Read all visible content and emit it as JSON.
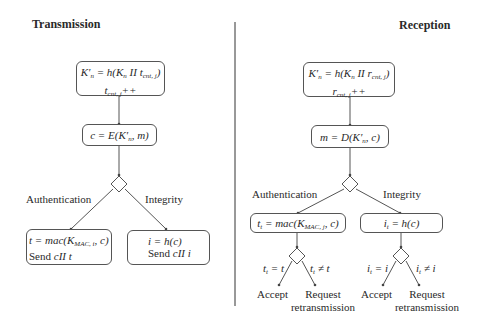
{
  "transmission": {
    "title": "Transmission",
    "key_box": {
      "line1_prefix": "K′",
      "line1_sub": "n",
      "line1_rest": " = h(K",
      "line1_sub2": "n",
      "line1_mid": " II t",
      "line1_sub3": "cnt, j",
      "line1_end": ")",
      "line2": "t",
      "line2_sub": "cnt, j",
      "line2_end": "++"
    },
    "encrypt_box": {
      "prefix": "c = E(K′",
      "sub": "n",
      "end": ", m)"
    },
    "branch_auth": "Authentication",
    "branch_integrity": "Integrity",
    "auth_box": {
      "line1_prefix": "t = mac(K",
      "line1_sub": "MAC, i",
      "line1_end": ", c)",
      "line2_prefix": "Send ",
      "line2_it": "cII t"
    },
    "integrity_box": {
      "line1": "i = h(c)",
      "line2_prefix": "Send ",
      "line2_it": "cII i"
    }
  },
  "reception": {
    "title": "Reception",
    "key_box": {
      "line1_prefix": "K′",
      "line1_sub": "n",
      "line1_rest": " = h(K",
      "line1_sub2": "n",
      "line1_mid": " II r",
      "line1_sub3": "cnt, j",
      "line1_end": ")",
      "line2": "r",
      "line2_sub": "cnt, j",
      "line2_end": "++"
    },
    "decrypt_box": {
      "prefix": "m = D(K′",
      "sub": "n",
      "end": ", c)"
    },
    "branch_auth": "Authentication",
    "branch_integrity": "Integrity",
    "auth_box": {
      "prefix": "t",
      "sub": "t",
      "mid": " = mac(K",
      "sub2": "MAC, j",
      "end": ", c)"
    },
    "integrity_box": {
      "prefix": "i",
      "sub": "t",
      "end": " = h(c)"
    },
    "auth_eq": {
      "a": "t",
      "sub": "t",
      "b": " = t"
    },
    "auth_neq": {
      "a": "t",
      "sub": "t",
      "b": " ≠ t"
    },
    "int_eq": {
      "a": "i",
      "sub": "t",
      "b": " = i"
    },
    "int_neq": {
      "a": "i",
      "sub": "t",
      "b": " ≠ i"
    },
    "accept": "Accept",
    "request_line1": "Request",
    "request_line2": "retransmission"
  },
  "colors": {
    "line": "#555555",
    "text": "#2a2a2a"
  }
}
